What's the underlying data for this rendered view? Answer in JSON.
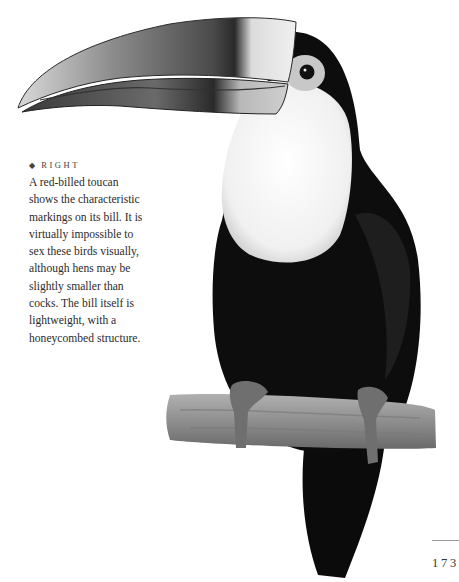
{
  "page": {
    "number": "173",
    "colors": {
      "background": "#ffffff",
      "text": "#2b2b2b",
      "plumage": "#0d0d0d",
      "bib": "#f4f4f4"
    }
  },
  "caption": {
    "bullet": "◆",
    "kicker": "RIGHT",
    "lines": [
      "A red-billed toucan",
      "shows the characteristic",
      "markings on its bill. It is",
      "virtually impossible to",
      "sex these birds visually,",
      "although hens may be",
      "slightly smaller than",
      "cocks. The bill itself is",
      "lightweight, with a",
      "honeycombed structure."
    ]
  },
  "photo": {
    "subject": "Red-billed toucan perched on a branch"
  }
}
